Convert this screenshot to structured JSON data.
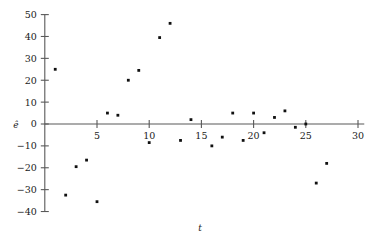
{
  "chart_data": {
    "type": "scatter",
    "title": "",
    "subtitle": "",
    "xlabel": "t",
    "ylabel": "ê",
    "xlim": [
      0,
      30.6
    ],
    "ylim": [
      -40,
      50
    ],
    "xticks": [
      5,
      10,
      15,
      20,
      25,
      30
    ],
    "yticks": [
      50,
      40,
      30,
      20,
      10,
      0,
      -10,
      -20,
      -30,
      -40
    ],
    "xtick_labels": [
      "5",
      "10",
      "15",
      "20",
      "25",
      "30"
    ],
    "ytick_labels": [
      "50",
      "40",
      "30",
      "20",
      "10",
      "0",
      "−10",
      "−20",
      "−30",
      "−40"
    ],
    "grid": false,
    "legend": null,
    "zero_line": 0,
    "marker": "square-dot",
    "marker_color": "#101010",
    "axis_color": "#595959",
    "background": "#ffffff",
    "x": [
      1,
      2,
      3,
      4,
      5,
      6,
      7,
      8,
      9,
      10,
      11,
      12,
      13,
      14,
      16,
      17,
      18,
      19,
      20,
      21,
      22,
      23,
      24,
      25,
      26,
      27
    ],
    "y": [
      25,
      -32.5,
      -19.5,
      -16.5,
      -35.5,
      5,
      4,
      20,
      24.5,
      -8.5,
      39.5,
      46,
      -7.5,
      2,
      -10,
      -6,
      5,
      -7.5,
      5,
      -4,
      3,
      6,
      -1.5,
      0,
      -27,
      -18
    ],
    "points": [
      {
        "t": 1,
        "e": 25
      },
      {
        "t": 2,
        "e": -32.5
      },
      {
        "t": 3,
        "e": -19.5
      },
      {
        "t": 4,
        "e": -16.5
      },
      {
        "t": 5,
        "e": -35.5
      },
      {
        "t": 6,
        "e": 5
      },
      {
        "t": 7,
        "e": 4
      },
      {
        "t": 8,
        "e": 20
      },
      {
        "t": 9,
        "e": 24.5
      },
      {
        "t": 10,
        "e": -8.5
      },
      {
        "t": 11,
        "e": 39.5
      },
      {
        "t": 12,
        "e": 46
      },
      {
        "t": 13,
        "e": -7.5
      },
      {
        "t": 14,
        "e": 2
      },
      {
        "t": 16,
        "e": -10
      },
      {
        "t": 17,
        "e": -6
      },
      {
        "t": 18,
        "e": 5
      },
      {
        "t": 19,
        "e": -7.5
      },
      {
        "t": 20,
        "e": 5
      },
      {
        "t": 21,
        "e": -4
      },
      {
        "t": 22,
        "e": 3
      },
      {
        "t": 23,
        "e": 6
      },
      {
        "t": 24,
        "e": -1.5
      },
      {
        "t": 25,
        "e": 0
      },
      {
        "t": 26,
        "e": -27
      },
      {
        "t": 27,
        "e": -18
      }
    ]
  }
}
